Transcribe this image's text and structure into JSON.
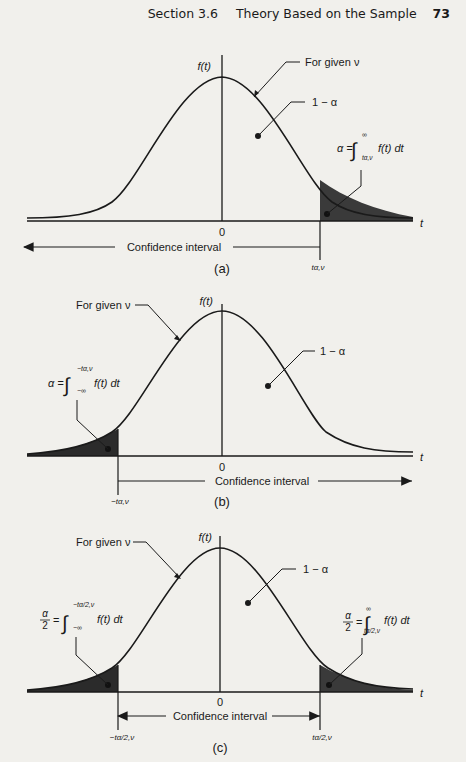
{
  "header": {
    "section": "Section 3.6",
    "title": "Theory Based on the Sample",
    "page_number": "73"
  },
  "common": {
    "y_axis_label": "f(t)",
    "x_axis_label": "t",
    "origin_label": "0",
    "curve_label": "For given ν",
    "center_area_label": "1 − α",
    "interval_label": "Confidence interval"
  },
  "panels": [
    {
      "id": "a",
      "caption": "(a)",
      "tail": "right",
      "tail_area_lhs": "α =",
      "tail_integral_upper": "∞",
      "tail_integral_lower": "tα,ν",
      "tail_integrand": "f(t) dt",
      "critical_labels": [
        "tα,ν"
      ]
    },
    {
      "id": "b",
      "caption": "(b)",
      "tail": "left",
      "tail_area_lhs": "α =",
      "tail_integral_upper": "−tα,ν",
      "tail_integral_lower": "−∞",
      "tail_integrand": "f(t) dt",
      "critical_labels": [
        "−tα,ν"
      ]
    },
    {
      "id": "c",
      "caption": "(c)",
      "tail": "both",
      "left_tail_lhs_num": "α",
      "left_tail_lhs_den": "2",
      "left_integral_upper": "−tα/2,ν",
      "left_integral_lower": "−∞",
      "right_tail_lhs_num": "α",
      "right_tail_lhs_den": "2",
      "right_integral_upper": "∞",
      "right_integral_lower": "tα/2,ν",
      "tail_integrand": "f(t) dt",
      "critical_labels": [
        "−tα/2,ν",
        "tα/2,ν"
      ]
    }
  ],
  "colors": {
    "paper": "#f1f0ec",
    "ink": "#1a1a1a",
    "shade": "#3a3a3a"
  }
}
